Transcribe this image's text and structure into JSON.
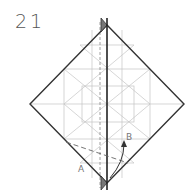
{
  "step": {
    "number": "21"
  },
  "labels": {
    "a": "A",
    "b": "B"
  },
  "colors": {
    "outline": "#333333",
    "crease": "#bbbbbb",
    "flap": "#777777",
    "text": "#555555"
  }
}
